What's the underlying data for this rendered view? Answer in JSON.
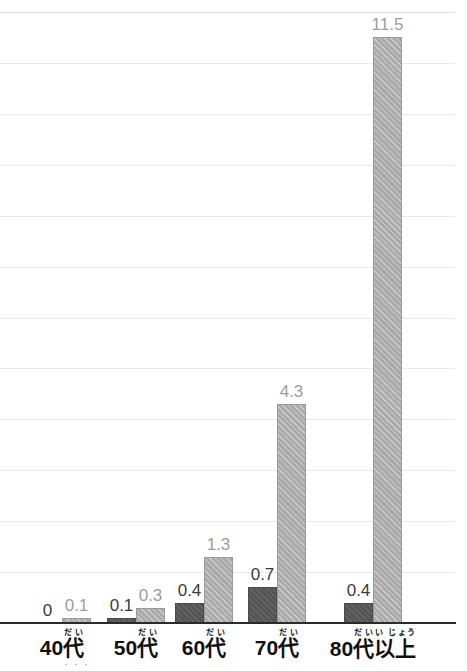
{
  "chart_data": {
    "type": "bar",
    "title": "",
    "subtitle": "",
    "xlabel": "",
    "ylabel": "",
    "categories": [
      "40代",
      "50代",
      "60代",
      "70代",
      "80代以上"
    ],
    "category_ruby": [
      {
        "base_before": "40",
        "kanji": "代",
        "ruby": "だい",
        "base_after": "",
        "ruby_after": ""
      },
      {
        "base_before": "50",
        "kanji": "代",
        "ruby": "だい",
        "base_after": "",
        "ruby_after": ""
      },
      {
        "base_before": "60",
        "kanji": "代",
        "ruby": "だい",
        "base_after": "",
        "ruby_after": ""
      },
      {
        "base_before": "70",
        "kanji": "代",
        "ruby": "だい",
        "base_after": "",
        "ruby_after": ""
      },
      {
        "base_before": "80",
        "kanji": "代",
        "ruby": "だい",
        "base_after": "以上",
        "ruby_after": "い じょう"
      }
    ],
    "series": [
      {
        "name": "dark",
        "values": [
          0,
          0.1,
          0.4,
          0.7,
          0.4
        ],
        "labels": [
          "0",
          "0.1",
          "0.4",
          "0.7",
          "0.4"
        ],
        "color": "#555555"
      },
      {
        "name": "light",
        "values": [
          0.1,
          0.3,
          1.3,
          4.3,
          11.5
        ],
        "labels": [
          "0.1",
          "0.3",
          "1.3",
          "4.3",
          "11.5"
        ],
        "color": "#ababab"
      }
    ],
    "ylim": [
      0,
      12
    ],
    "gridlines": [
      0,
      1,
      2,
      3,
      4,
      5,
      6,
      7,
      8,
      9,
      10,
      11,
      12
    ],
    "grid": true,
    "legend": "none",
    "axis_color": "#2b2b2b",
    "grid_color": "#e9e9e9"
  },
  "artifact": {
    "bottom_fragment": "・・・"
  }
}
